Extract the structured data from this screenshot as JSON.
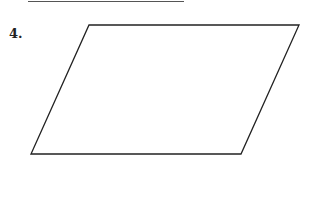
{
  "problem": {
    "number": "4."
  },
  "figure": {
    "shape": "parallelogram",
    "stroke": "#222222",
    "points": "89,25 299,25 241,154 31,154"
  }
}
